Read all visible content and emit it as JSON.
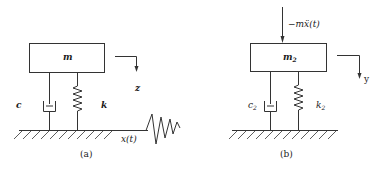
{
  "diagram": {
    "type": "mechanical single-degree-of-freedom mass-spring-damper systems",
    "colors": {
      "line": "#333333",
      "text": "#1a1a1a",
      "background": "#ffffff"
    },
    "panel_a": {
      "caption": "(a)",
      "mass_label": "m",
      "damper_label": "c",
      "spring_label": "k",
      "displacement_label": "z",
      "base_excitation_label": "x(t)"
    },
    "panel_b": {
      "caption": "(b)",
      "mass_label": "m",
      "mass_subscript": "2",
      "damper_label": "c",
      "damper_subscript": "2",
      "spring_label": "k",
      "spring_subscript": "2",
      "displacement_label": "y",
      "force_label": "−mẍ(t)"
    }
  }
}
